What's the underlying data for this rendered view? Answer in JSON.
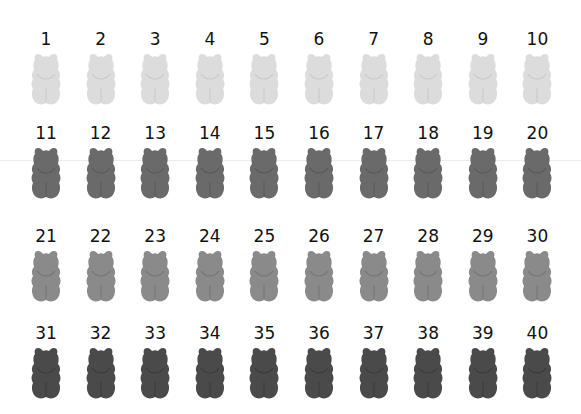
{
  "grid": {
    "columns": 10,
    "rows": [
      {
        "color": "#dcdcdc",
        "shade": "#c8c8c8",
        "label_top": 30,
        "bear_top": 52,
        "items": [
          "1",
          "2",
          "3",
          "4",
          "5",
          "6",
          "7",
          "8",
          "9",
          "10"
        ]
      },
      {
        "color": "#6a6a6a",
        "shade": "#585858",
        "label_top": 124,
        "bear_top": 146,
        "items": [
          "11",
          "12",
          "13",
          "14",
          "15",
          "16",
          "17",
          "18",
          "19",
          "20"
        ]
      },
      {
        "color": "#8a8a8a",
        "shade": "#747474",
        "label_top": 227,
        "bear_top": 249,
        "items": [
          "21",
          "22",
          "23",
          "24",
          "25",
          "26",
          "27",
          "28",
          "29",
          "30"
        ]
      },
      {
        "color": "#4a4a4a",
        "shade": "#3a3a3a",
        "label_top": 324,
        "bear_top": 346,
        "items": [
          "31",
          "32",
          "33",
          "34",
          "35",
          "36",
          "37",
          "38",
          "39",
          "40"
        ]
      }
    ]
  },
  "icon": "gummy-bear-icon"
}
